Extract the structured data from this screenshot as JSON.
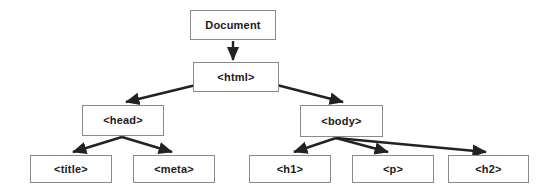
{
  "diagram": {
    "type": "tree",
    "background_color": "#ffffff",
    "node_border_color": "#8a8a8a",
    "node_fill_color": "#ffffff",
    "edge_color": "#222222",
    "text_color": "#1b1b1b",
    "nodes": [
      {
        "id": "document",
        "label": "Document",
        "level": 0
      },
      {
        "id": "html",
        "label": "<html>",
        "level": 1
      },
      {
        "id": "head",
        "label": "<head>",
        "level": 2
      },
      {
        "id": "body",
        "label": "<body>",
        "level": 2
      },
      {
        "id": "title",
        "label": "<title>",
        "level": 3
      },
      {
        "id": "meta",
        "label": "<meta>",
        "level": 3
      },
      {
        "id": "h1",
        "label": "<h1>",
        "level": 3
      },
      {
        "id": "p",
        "label": "<p>",
        "level": 3
      },
      {
        "id": "h2",
        "label": "<h2>",
        "level": 3
      }
    ],
    "edges": [
      {
        "from": "document",
        "to": "html"
      },
      {
        "from": "html",
        "to": "head"
      },
      {
        "from": "html",
        "to": "body"
      },
      {
        "from": "head",
        "to": "title"
      },
      {
        "from": "head",
        "to": "meta"
      },
      {
        "from": "body",
        "to": "h1"
      },
      {
        "from": "body",
        "to": "p"
      },
      {
        "from": "body",
        "to": "h2"
      }
    ]
  }
}
